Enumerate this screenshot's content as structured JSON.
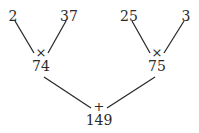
{
  "tree": {
    "leaves": [
      "2",
      "37",
      "25",
      "3"
    ],
    "left": {
      "operator": "×",
      "result": "74"
    },
    "right": {
      "operator": "×",
      "result": "75"
    },
    "root": {
      "operator": "+",
      "result": "149"
    }
  },
  "colors": {
    "line": "#2a2a2a",
    "text": "#2a2a2a",
    "background": "#ffffff"
  }
}
